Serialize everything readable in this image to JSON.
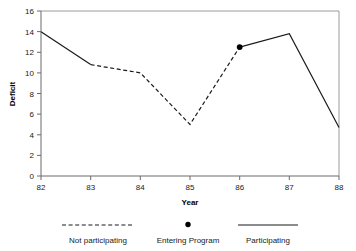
{
  "chart_data": {
    "type": "line",
    "title": "",
    "subtitle": "",
    "xlabel": "Year",
    "ylabel": "Deficit",
    "x": [
      82,
      83,
      84,
      85,
      86,
      87,
      88
    ],
    "xtick_labels": [
      "82",
      "83",
      "84",
      "85",
      "86",
      "87",
      "88"
    ],
    "ytick_labels": [
      "0",
      "2",
      "4",
      "6",
      "8",
      "10",
      "12",
      "14",
      "16"
    ],
    "ytick_values": [
      0,
      2,
      4,
      6,
      8,
      10,
      12,
      14,
      16
    ],
    "xlim": [
      82,
      88
    ],
    "ylim": [
      0,
      16
    ],
    "grid": false,
    "legend_position": "below",
    "values": [
      14.0,
      10.8,
      10.0,
      5.0,
      12.5,
      13.8,
      4.7
    ],
    "series": [
      {
        "name": "Participating",
        "style": "solid",
        "segments": [
          {
            "x": [
              82,
              83
            ],
            "y": [
              14.0,
              10.8
            ]
          },
          {
            "x": [
              86,
              87,
              88
            ],
            "y": [
              12.5,
              13.8,
              4.7
            ]
          }
        ]
      },
      {
        "name": "Not participating",
        "style": "dashed",
        "segments": [
          {
            "x": [
              83,
              84,
              85,
              86
            ],
            "y": [
              10.8,
              10.0,
              5.0,
              12.5
            ]
          }
        ]
      },
      {
        "name": "Entering Program",
        "style": "marker",
        "points": [
          {
            "x": 86,
            "y": 12.5
          }
        ]
      }
    ],
    "annotations": []
  },
  "legend": {
    "items": [
      {
        "label": "Not participating",
        "marker": "dashed-line"
      },
      {
        "label": "Entering Program",
        "marker": "filled-dot"
      },
      {
        "label": "Participating",
        "marker": "solid-line"
      }
    ]
  },
  "colors": {
    "line": "#1a1a1a",
    "axis": "#6b6b6b",
    "frame": "#9a9a9a",
    "text": "#1a1a1a",
    "background": "#ffffff"
  }
}
